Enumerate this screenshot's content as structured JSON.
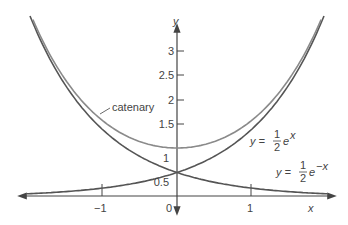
{
  "chart_data": {
    "type": "line",
    "title": "",
    "xlabel": "x",
    "ylabel": "y",
    "xlim": [
      -2.05,
      2.05
    ],
    "ylim": [
      0,
      3.7
    ],
    "x_ticks": [
      "-1",
      "0",
      "1"
    ],
    "y_ticks": [
      "0.5",
      "1",
      "1.5",
      "2",
      "2.5",
      "3"
    ],
    "series": [
      {
        "name": "catenary",
        "formula": "y = cosh(x) = (e^x + e^-x)/2",
        "x": [
          -2,
          -1.5,
          -1,
          -0.5,
          0,
          0.5,
          1,
          1.5,
          2
        ],
        "values": [
          3.76,
          2.35,
          1.54,
          1.13,
          1.0,
          1.13,
          1.54,
          2.35,
          3.76
        ]
      },
      {
        "name": "y = 1/2 e^x",
        "x": [
          -2,
          -1.5,
          -1,
          -0.5,
          0,
          0.5,
          1,
          1.5,
          2
        ],
        "values": [
          0.07,
          0.11,
          0.18,
          0.3,
          0.5,
          0.82,
          1.36,
          2.24,
          3.69
        ]
      },
      {
        "name": "y = 1/2 e^-x",
        "x": [
          -2,
          -1.5,
          -1,
          -0.5,
          0,
          0.5,
          1,
          1.5,
          2
        ],
        "values": [
          3.69,
          2.24,
          1.36,
          0.82,
          0.5,
          0.3,
          0.18,
          0.11,
          0.07
        ]
      }
    ],
    "annotations": [
      "catenary",
      "y = 1/2 e^x",
      "y = 1/2 e^-x"
    ],
    "grid": false
  },
  "labels": {
    "x_axis": "x",
    "y_axis": "y",
    "catenary": "catenary",
    "tick_x_neg1": "−1",
    "tick_x_0": "0",
    "tick_x_1": "1",
    "tick_y_05": "0.5",
    "tick_y_1": "1",
    "tick_y_15": "1.5",
    "tick_y_2": "2",
    "tick_y_25": "2.5",
    "tick_y_3": "3",
    "ex_prefix": "y =",
    "ex_num": "1",
    "ex_den": "2",
    "ex_base": "e",
    "ex_exp": "x",
    "emx_prefix": "y =",
    "emx_num": "1",
    "emx_den": "2",
    "emx_base": "e",
    "emx_exp": "−x"
  },
  "colors": {
    "axis": "#444444",
    "catenary": "#8a8a8a",
    "exp_curves": "#555555"
  }
}
